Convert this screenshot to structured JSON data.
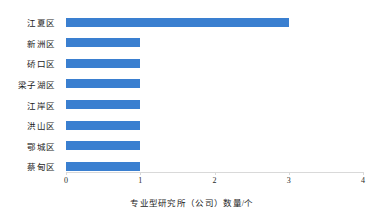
{
  "chart_data": {
    "type": "bar",
    "orientation": "horizontal",
    "title": "",
    "xlabel": "专业型研究所（公司）数量/个",
    "ylabel": "",
    "categories": [
      "江夏区",
      "新洲区",
      "硚口区",
      "梁子湖区",
      "江岸区",
      "洪山区",
      "鄂城区",
      "蔡甸区"
    ],
    "values": [
      3,
      1,
      1,
      1,
      1,
      1,
      1,
      1
    ],
    "xlim": [
      0,
      4
    ],
    "xticks": [
      0,
      1,
      2,
      3,
      4
    ],
    "xtick_labels": [
      "0",
      "1",
      "2",
      "3",
      "4"
    ],
    "grid": false,
    "legend": null,
    "bar_color": "#3a7fd0",
    "axis_color": "#d9d9d9",
    "background": "#ffffff"
  }
}
